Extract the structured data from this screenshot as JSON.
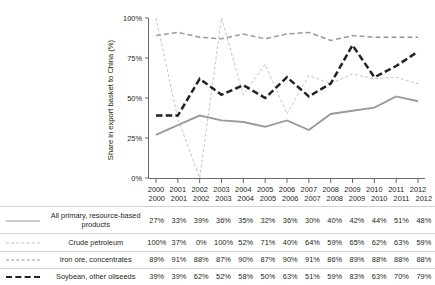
{
  "chart_data": {
    "type": "line",
    "title": "",
    "xlabel": "",
    "ylabel": "Share in export basket to China (%)",
    "x": [
      2000,
      2001,
      2002,
      2003,
      2004,
      2005,
      2006,
      2007,
      2008,
      2009,
      2010,
      2011,
      2012
    ],
    "categories": [
      "2000",
      "2001",
      "2002",
      "2003",
      "2004",
      "2005",
      "2006",
      "2007",
      "2008",
      "2009",
      "2010",
      "2011",
      "2012"
    ],
    "xtick_labels": [
      "2000",
      "2001",
      "2002",
      "2003",
      "2004",
      "2005",
      "2006",
      "2007",
      "2008",
      "2009",
      "2010",
      "2011",
      "2012"
    ],
    "ytick_labels": [
      "0%",
      "25%",
      "50%",
      "75%",
      "100%"
    ],
    "yticks": [
      0,
      25,
      50,
      75,
      100
    ],
    "ylim": [
      0,
      100
    ],
    "xlim": [
      2000,
      2012
    ],
    "grid": false,
    "legend_position": "below-table",
    "series": [
      {
        "name": "All primary, resource-based products",
        "style": "solid",
        "color": "#9a9a9a",
        "values": [
          27,
          33,
          39,
          36,
          35,
          32,
          36,
          30,
          40,
          42,
          44,
          51,
          48
        ],
        "value_labels": [
          "27%",
          "33%",
          "39%",
          "36%",
          "35%",
          "32%",
          "36%",
          "30%",
          "40%",
          "42%",
          "44%",
          "51%",
          "48%"
        ]
      },
      {
        "name": "Crude petroleum",
        "style": "dotted",
        "color": "#c4c4c4",
        "values": [
          100,
          37,
          0,
          100,
          52,
          71,
          40,
          64,
          59,
          65,
          62,
          63,
          59
        ],
        "value_labels": [
          "100%",
          "37%",
          "0%",
          "100%",
          "52%",
          "71%",
          "40%",
          "64%",
          "59%",
          "65%",
          "62%",
          "63%",
          "59%"
        ]
      },
      {
        "name": "Iron ore, concentrates",
        "style": "dashed",
        "color": "#9a9a9a",
        "values": [
          89,
          91,
          88,
          87,
          90,
          87,
          90,
          91,
          86,
          89,
          88,
          88,
          88
        ],
        "value_labels": [
          "89%",
          "91%",
          "88%",
          "87%",
          "90%",
          "87%",
          "90%",
          "91%",
          "86%",
          "89%",
          "88%",
          "88%",
          "88%"
        ]
      },
      {
        "name": "Soybean, other oilseeds",
        "style": "bold-dashed",
        "color": "#222222",
        "values": [
          39,
          39,
          62,
          52,
          58,
          50,
          63,
          51,
          59,
          83,
          63,
          70,
          79
        ],
        "value_labels": [
          "39%",
          "39%",
          "62%",
          "52%",
          "58%",
          "50%",
          "63%",
          "51%",
          "59%",
          "83%",
          "63%",
          "70%",
          "79%"
        ]
      }
    ]
  },
  "table": {
    "corner_label": "",
    "year_headers": [
      "2000",
      "2001",
      "2002",
      "2003",
      "2004",
      "2005",
      "2006",
      "2007",
      "2008",
      "2009",
      "2010",
      "2011",
      "2012"
    ],
    "rows": [
      {
        "label_line1": "All primary, resource-based",
        "label_line2": "products",
        "swatch": "line-solid-icon",
        "values": [
          "27%",
          "33%",
          "39%",
          "36%",
          "35%",
          "32%",
          "36%",
          "30%",
          "40%",
          "42%",
          "44%",
          "51%",
          "48%"
        ]
      },
      {
        "label_line1": "Crude petroleum",
        "label_line2": "",
        "swatch": "line-dotted-icon",
        "values": [
          "100%",
          "37%",
          "0%",
          "100%",
          "52%",
          "71%",
          "40%",
          "64%",
          "59%",
          "65%",
          "62%",
          "63%",
          "59%"
        ]
      },
      {
        "label_line1": "Iron ore, concentrates",
        "label_line2": "",
        "swatch": "line-dashed-icon",
        "values": [
          "89%",
          "91%",
          "88%",
          "87%",
          "90%",
          "87%",
          "90%",
          "91%",
          "86%",
          "89%",
          "88%",
          "88%",
          "88%"
        ]
      },
      {
        "label_line1": "Soybean, other oilseeds",
        "label_line2": "",
        "swatch": "line-bold-dashed-icon",
        "values": [
          "39%",
          "39%",
          "62%",
          "52%",
          "58%",
          "50%",
          "63%",
          "51%",
          "59%",
          "83%",
          "63%",
          "70%",
          "79%"
        ]
      }
    ]
  },
  "colors": {
    "axis": "#58595b",
    "text": "#231f20",
    "rule": "#d2d2d2",
    "series_solid": "#9a9a9a",
    "series_dotted": "#c4c4c4",
    "series_dashed": "#9a9a9a",
    "series_bold_dashed": "#222222"
  }
}
